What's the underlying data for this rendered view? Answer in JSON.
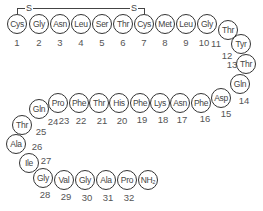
{
  "title": "",
  "disulfide_bridge": {
    "label_left": "S",
    "label_right": "S",
    "from_residue": 1,
    "to_residue": 7
  },
  "residues": [
    {
      "n": "1",
      "name": "Cys",
      "x": 17,
      "y": 24,
      "lx": 17,
      "ly": 42
    },
    {
      "n": "2",
      "name": "Gly",
      "x": 39,
      "y": 24,
      "lx": 39,
      "ly": 42
    },
    {
      "n": "3",
      "name": "Asn",
      "x": 60,
      "y": 24,
      "lx": 60,
      "ly": 42
    },
    {
      "n": "4",
      "name": "Leu",
      "x": 81,
      "y": 24,
      "lx": 81,
      "ly": 42
    },
    {
      "n": "5",
      "name": "Ser",
      "x": 102,
      "y": 24,
      "lx": 102,
      "ly": 42
    },
    {
      "n": "6",
      "name": "Thr",
      "x": 123,
      "y": 24,
      "lx": 123,
      "ly": 42
    },
    {
      "n": "7",
      "name": "Cys",
      "x": 144,
      "y": 24,
      "lx": 144,
      "ly": 42
    },
    {
      "n": "8",
      "name": "Met",
      "x": 165,
      "y": 24,
      "lx": 165,
      "ly": 42
    },
    {
      "n": "9",
      "name": "Leu",
      "x": 186,
      "y": 24,
      "lx": 186,
      "ly": 42
    },
    {
      "n": "10",
      "name": "Gly",
      "x": 207,
      "y": 24,
      "lx": 204,
      "ly": 42
    },
    {
      "n": "11",
      "name": "Thr",
      "x": 228,
      "y": 30,
      "lx": 216,
      "ly": 43
    },
    {
      "n": "12",
      "name": "Tyr",
      "x": 241,
      "y": 44,
      "lx": 227,
      "ly": 55
    },
    {
      "n": "13",
      "name": "Thr",
      "x": 246,
      "y": 64,
      "lx": 232,
      "ly": 64
    },
    {
      "n": "14",
      "name": "Gln",
      "x": 240,
      "y": 84,
      "lx": 244,
      "ly": 100
    },
    {
      "n": "15",
      "name": "Asp",
      "x": 221,
      "y": 98,
      "lx": 226,
      "ly": 113
    },
    {
      "n": "16",
      "name": "Phe",
      "x": 201,
      "y": 103,
      "lx": 205,
      "ly": 118
    },
    {
      "n": "17",
      "name": "Asn",
      "x": 180,
      "y": 103,
      "lx": 182,
      "ly": 119
    },
    {
      "n": "18",
      "name": "Lys",
      "x": 160,
      "y": 103,
      "lx": 163,
      "ly": 119
    },
    {
      "n": "19",
      "name": "Phe",
      "x": 140,
      "y": 103,
      "lx": 142,
      "ly": 119
    },
    {
      "n": "20",
      "name": "His",
      "x": 119,
      "y": 103,
      "lx": 122,
      "ly": 120
    },
    {
      "n": "21",
      "name": "Thr",
      "x": 99,
      "y": 103,
      "lx": 102,
      "ly": 120
    },
    {
      "n": "22",
      "name": "Phe",
      "x": 79,
      "y": 103,
      "lx": 81,
      "ly": 120
    },
    {
      "n": "23",
      "name": "Pro",
      "x": 58,
      "y": 103,
      "lx": 64,
      "ly": 120
    },
    {
      "n": "24",
      "name": "Gln",
      "x": 39,
      "y": 109,
      "lx": 53,
      "ly": 121
    },
    {
      "n": "25",
      "name": "Thr",
      "x": 22,
      "y": 125,
      "lx": 41,
      "ly": 131
    },
    {
      "n": "26",
      "name": "Ala",
      "x": 16,
      "y": 144,
      "lx": 37,
      "ly": 146
    },
    {
      "n": "27",
      "name": "Ile",
      "x": 29,
      "y": 163,
      "lx": 46,
      "ly": 160
    },
    {
      "n": "28",
      "name": "Gly",
      "x": 43,
      "y": 178,
      "lx": 45,
      "ly": 194
    },
    {
      "n": "29",
      "name": "Val",
      "x": 64,
      "y": 180,
      "lx": 66,
      "ly": 196
    },
    {
      "n": "30",
      "name": "Gly",
      "x": 85,
      "y": 180,
      "lx": 87,
      "ly": 197
    },
    {
      "n": "31",
      "name": "Ala",
      "x": 106,
      "y": 180,
      "lx": 108,
      "ly": 197
    },
    {
      "n": "32",
      "name": "Pro",
      "x": 127,
      "y": 180,
      "lx": 129,
      "ly": 197
    },
    {
      "n": "",
      "name": "NH₂",
      "x": 148,
      "y": 180,
      "lx": 0,
      "ly": 0
    }
  ]
}
